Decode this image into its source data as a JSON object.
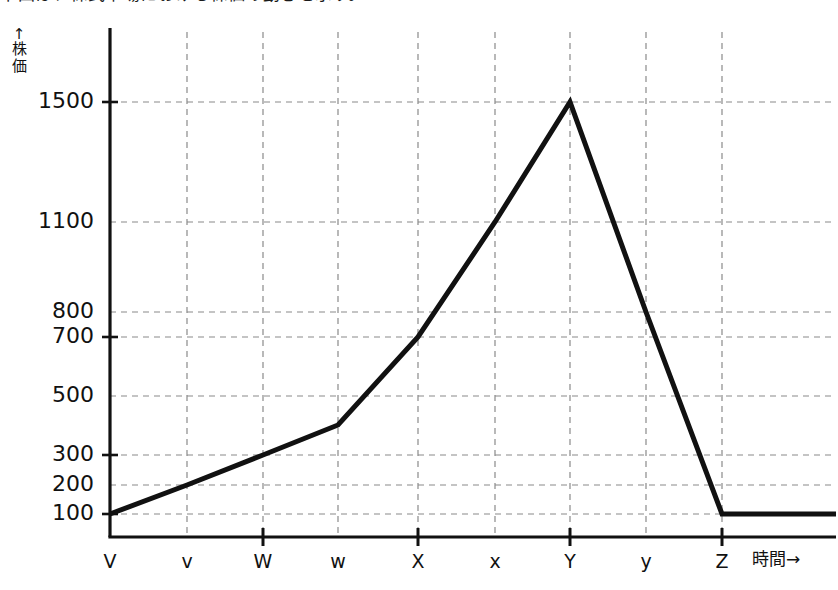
{
  "chart_data": {
    "type": "line",
    "title": "下図は、株式市場における株価の動きを示す。",
    "xlabel": "時間→",
    "ylabel": "↑株価",
    "ylabel_chars": [
      "株",
      "価"
    ],
    "x_axis_arrow": "→",
    "y_axis_arrow": "↑",
    "categories": [
      "V",
      "v",
      "W",
      "w",
      "X",
      "x",
      "Y",
      "y",
      "Z"
    ],
    "values": [
      100,
      200,
      300,
      500,
      700,
      1100,
      1500,
      800,
      100
    ],
    "series": [
      {
        "name": "株価",
        "x": [
          "V",
          "v",
          "W",
          "w",
          "X",
          "x",
          "Y",
          "y",
          "Z"
        ],
        "values": [
          100,
          200,
          300,
          500,
          700,
          1100,
          1500,
          800,
          100
        ]
      }
    ],
    "vertex_points": [
      {
        "label": "V",
        "value": 100
      },
      {
        "label": "W",
        "value": 300
      },
      {
        "label": "X",
        "value": 700
      },
      {
        "label": "Y",
        "value": 1500
      },
      {
        "label": "Z",
        "value": 100
      }
    ],
    "tail_flat_value": 100,
    "ytick_labels": [
      "1500",
      "1100",
      "800",
      "700",
      "500",
      "300",
      "200",
      "100"
    ],
    "ytick_values": [
      1500,
      1100,
      800,
      700,
      500,
      300,
      200,
      100
    ],
    "xtick_labels": [
      "V",
      "v",
      "W",
      "w",
      "X",
      "x",
      "Y",
      "y",
      "Z"
    ],
    "major_xticks": [
      "V",
      "W",
      "X",
      "Y",
      "Z"
    ],
    "minor_xticks": [
      "v",
      "w",
      "x",
      "y"
    ],
    "major_yticks": [
      1500,
      700,
      300,
      100
    ],
    "grid": true,
    "grid_style": "dashed",
    "legend": null,
    "ylim": [
      0,
      1700
    ],
    "line_color": "#111111",
    "grid_color": "#8a8a8a",
    "axis_color": "#111111",
    "background_color": "#ffffff"
  },
  "geometry": {
    "ytick_py": [
      102,
      222,
      312,
      337,
      396,
      455,
      485,
      514
    ],
    "xtick_px": [
      110,
      187,
      263,
      338,
      418,
      495,
      570,
      646,
      722
    ],
    "axis_x": 110,
    "axis_y": 537,
    "axis_top": 28,
    "axis_right": 836,
    "polyline": "110,514 187,485 263,455 338,425 418,337 495,222 570,102 646,312 722,514 836,514"
  }
}
